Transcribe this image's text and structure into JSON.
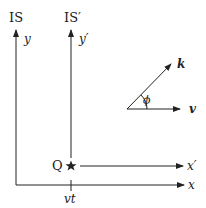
{
  "frames": {
    "unprimed": {
      "title": "IS",
      "y_label": "y",
      "x_label": "x"
    },
    "primed": {
      "title": "IS′",
      "y_label": "y′",
      "x_label": "x′"
    }
  },
  "point": {
    "label": "Q"
  },
  "tick": {
    "label": "vt"
  },
  "vectors": {
    "k_label": "k",
    "v_label": "v",
    "angle_label": "ϕ"
  },
  "colors": {
    "ink": "#222222",
    "background": "#ffffff"
  }
}
